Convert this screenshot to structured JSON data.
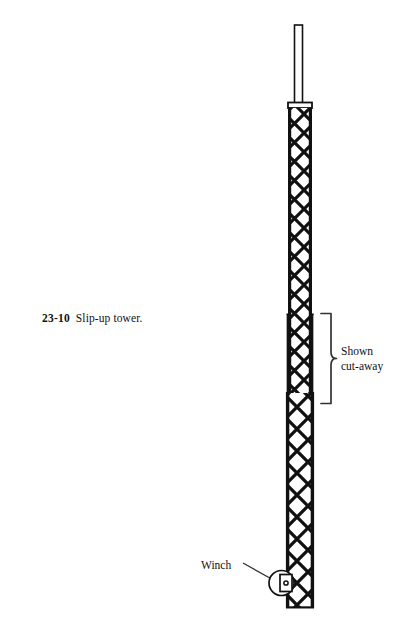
{
  "figure": {
    "caption": {
      "number": "23-10",
      "text": "Slip-up tower."
    },
    "annotations": {
      "cutaway_line1": "Shown",
      "cutaway_line2": "cut-away",
      "winch": "Winch"
    },
    "icons": {
      "bracket": "curly-brace-icon",
      "leader": "leader-line-icon",
      "winch_drum": "winch-drum-icon",
      "mast": "antenna-mast-icon",
      "lattice_upper": "lattice-tower-upper-icon",
      "lattice_lower": "lattice-tower-lower-icon"
    },
    "colors": {
      "ink": "#111111",
      "background": "#ffffff",
      "line": "#1a1a1a"
    },
    "geometry": {
      "mast_top_y": 25,
      "mast_bottom_y": 106,
      "upper_tower_top_y": 107,
      "upper_tower_bottom_y": 404,
      "lower_tower_top_y": 313,
      "lower_tower_bottom_y": 608,
      "bracket_top_y": 313,
      "bracket_bottom_y": 404,
      "winch_center_y": 583
    }
  }
}
